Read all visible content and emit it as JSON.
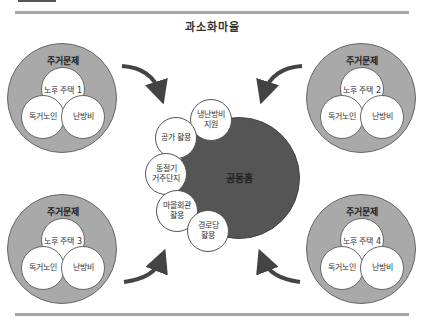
{
  "title": "과소화마을",
  "groups": [
    {
      "label": "주거문제",
      "top": "노후 주택 1",
      "bottom_left": "독거노인",
      "bottom_right": "난방비"
    },
    {
      "label": "주거문제",
      "top": "노후 주택 2",
      "bottom_left": "독거노인",
      "bottom_right": "난방비"
    },
    {
      "label": "주거문제",
      "top": "노후 주택 3",
      "bottom_left": "독거노인",
      "bottom_right": "난방비"
    },
    {
      "label": "주거문제",
      "top": "노후 주택 4",
      "bottom_left": "독거노인",
      "bottom_right": "난방비"
    }
  ],
  "hub": {
    "label": "공동홈"
  },
  "satellites": [
    {
      "line1": "냉난방비",
      "line2": "지원"
    },
    {
      "line1": "공가 활용",
      "line2": ""
    },
    {
      "line1": "동절기",
      "line2": "거주단지"
    },
    {
      "line1": "마을회관",
      "line2": "활용"
    },
    {
      "line1": "경로당",
      "line2": "활용"
    }
  ],
  "colors": {
    "outer_circle": "#a9a9a9",
    "hub": "#555555",
    "rule": "#a6a6a6",
    "arrow": "#444444"
  }
}
